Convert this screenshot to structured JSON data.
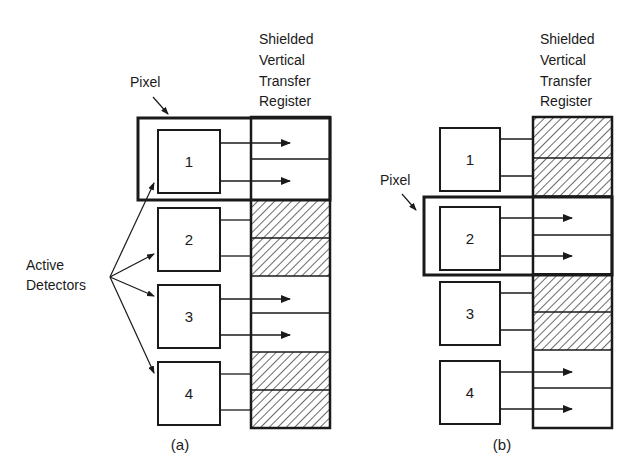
{
  "figure": {
    "panel_a": {
      "caption": "(a)",
      "register_title": [
        "Shielded",
        "Vertical",
        "Transfer",
        "Register"
      ],
      "pixel_label": "Pixel",
      "active_label": [
        "Active",
        "Detectors"
      ],
      "detectors": [
        "1",
        "2",
        "3",
        "4"
      ],
      "register_cells": [
        "open",
        "open",
        "shielded",
        "shielded",
        "open",
        "open",
        "shielded",
        "shielded"
      ],
      "pixel_highlight": "detector 1"
    },
    "panel_b": {
      "caption": "(b)",
      "register_title": [
        "Shielded",
        "Vertical",
        "Transfer",
        "Register"
      ],
      "pixel_label": "Pixel",
      "detectors": [
        "1",
        "2",
        "3",
        "4"
      ],
      "register_cells": [
        "shielded",
        "shielded",
        "open",
        "open",
        "shielded",
        "shielded",
        "open",
        "open"
      ],
      "pixel_highlight": "detector 2"
    },
    "colors": {
      "ink": "#1a1a1a",
      "background": "#ffffff"
    }
  }
}
